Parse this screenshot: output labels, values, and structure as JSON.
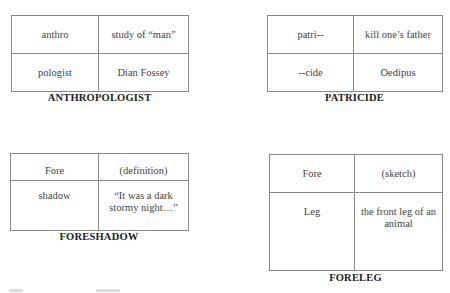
{
  "cards": [
    {
      "word": "ANTHROPOLOGIST",
      "cells": [
        [
          "anthro",
          "study of “man”"
        ],
        [
          "pologist",
          "Dian Fossey"
        ]
      ]
    },
    {
      "word": "PATRICIDE",
      "cells": [
        [
          "patri--",
          "kill one’s father"
        ],
        [
          "--cide",
          "Oedipus"
        ]
      ]
    },
    {
      "word": "FORESHADOW",
      "cells": [
        [
          "Fore",
          "(definition)"
        ],
        [
          "shadow",
          "“It was a dark stormy night…”"
        ]
      ]
    },
    {
      "word": "FORELEG",
      "cells": [
        [
          "Fore",
          "(sketch)"
        ],
        [
          "Leg",
          "the front leg of an animal"
        ]
      ]
    }
  ]
}
